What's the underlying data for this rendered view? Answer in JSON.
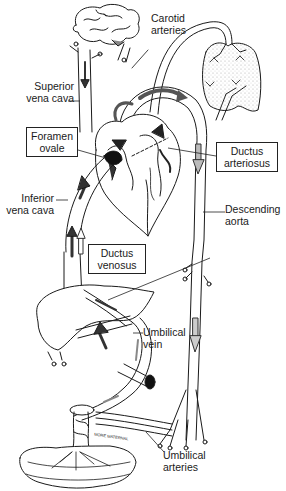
{
  "labels": {
    "carotid_arteries": [
      "Carotid",
      "arteries"
    ],
    "superior_vena_cava": [
      "Superior",
      "vena cava"
    ],
    "foramen_ovale": [
      "Foramen",
      "ovale"
    ],
    "ductus_arteriosus": [
      "Ductus",
      "arteriosus"
    ],
    "inferior_vena_cava": [
      "Inferior",
      "vena cava"
    ],
    "descending_aorta": [
      "Descending",
      "aorta"
    ],
    "ductus_venosus": [
      "Ductus",
      "venosus"
    ],
    "umbilical_vein": [
      "Umbilical",
      "vein"
    ],
    "umbilical_arteries": [
      "Umbilical",
      "arteries"
    ],
    "placenta_text": "MORE MATERNAL"
  },
  "colors": {
    "line": "#1a1a1a",
    "oxygenated_arrow": "#555555",
    "mixed_arrow": "#aaaaaa",
    "lung_stipple": "#bbbbbb"
  }
}
